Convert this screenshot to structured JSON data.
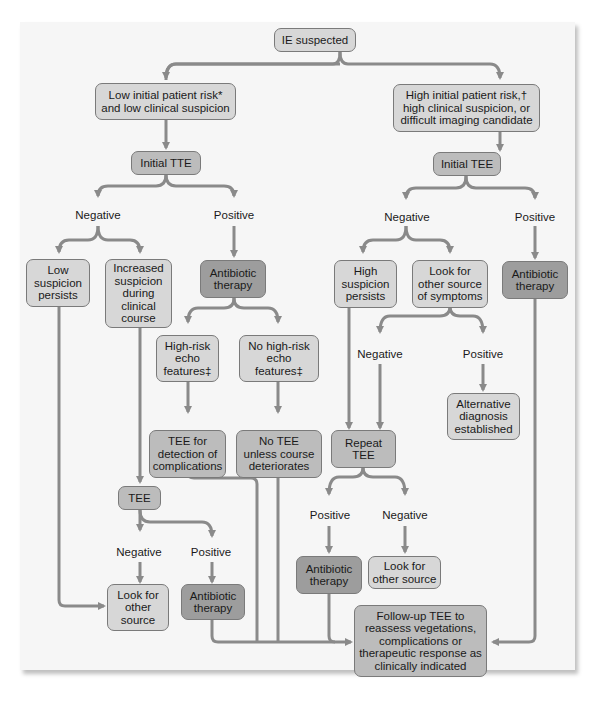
{
  "colors": {
    "panel_bg": "#f6f6f6",
    "box_light": "#d7d7d7",
    "box_mid": "#bcbcbc",
    "box_dark": "#9d9d9d",
    "connector": "#8a8a8a"
  },
  "nodes": {
    "ie_suspected": "IE suspected",
    "low_risk": "Low initial patient risk*\nand low clinical suspicion",
    "high_risk": "High initial patient risk,†\nhigh clinical suspicion, or\ndifficult imaging candidate",
    "initial_tte": "Initial TTE",
    "initial_tee": "Initial TEE",
    "low_suspicion_persists": "Low\nsuspicion\npersists",
    "increased_suspicion": "Increased\nsuspicion\nduring\nclinical\ncourse",
    "antibiotic_left": "Antibiotic\ntherapy",
    "high_risk_echo": "High-risk\necho\nfeatures‡",
    "no_high_risk_echo": "No high-risk\necho\nfeatures‡",
    "tee_complications": "TEE for\ndetection of\ncomplications",
    "no_tee": "No TEE\nunless course\ndeteriorates",
    "tee": "TEE",
    "look_other_source_left": "Look for\nother\nsource",
    "antibiotic_bottom_left": "Antibiotic\ntherapy",
    "high_suspicion_persists": "High\nsuspicion\npersists",
    "look_other_symptoms": "Look for\nother source\nof symptoms",
    "antibiotic_right": "Antibiotic\ntherapy",
    "alternative_diagnosis": "Alternative\ndiagnosis\nestablished",
    "repeat_tee": "Repeat\nTEE",
    "antibiotic_repeat": "Antibiotic\ntherapy",
    "look_other_source_right": "Look for\nother source",
    "followup_tee": "Follow-up TEE to\nreassess vegetations,\ncomplications or\ntherapeutic response as\nclinically indicated"
  },
  "labels": {
    "tte_negative": "Negative",
    "tte_positive": "Positive",
    "tee_negative": "Negative",
    "tee_positive": "Positive",
    "symptoms_negative": "Negative",
    "symptoms_positive": "Positive",
    "repeat_positive": "Positive",
    "repeat_negative": "Negative",
    "tee2_negative": "Negative",
    "tee2_positive": "Positive"
  }
}
